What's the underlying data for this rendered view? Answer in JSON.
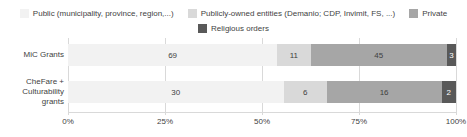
{
  "chart_data": {
    "type": "bar",
    "subtype": "horizontal-stacked-100-percent",
    "title": "",
    "xlabel": "",
    "ylabel": "",
    "xlim": [
      0,
      100
    ],
    "xticks": [
      "0%",
      "25%",
      "50%",
      "75%",
      "100%"
    ],
    "grid": true,
    "legend_position": "top",
    "categories": [
      "MiC Grants",
      "CheFare + Culturability grants"
    ],
    "series": [
      {
        "name": "Public (municipality, province, region,...)",
        "color": "#f2f2f2",
        "label_color": "#3f3f3f",
        "values": [
          69,
          30
        ]
      },
      {
        "name": "Publicly-owned entities (Demanio; CDP, Invimit, FS, ...)",
        "color": "#d9d9d9",
        "label_color": "#3f3f3f",
        "values": [
          11,
          6
        ]
      },
      {
        "name": "Private",
        "color": "#a6a6a6",
        "label_color": "#3f3f3f",
        "values": [
          45,
          16
        ]
      },
      {
        "name": "Religious orders",
        "color": "#595959",
        "label_color": "#ffffff",
        "values": [
          3,
          2
        ]
      }
    ]
  }
}
